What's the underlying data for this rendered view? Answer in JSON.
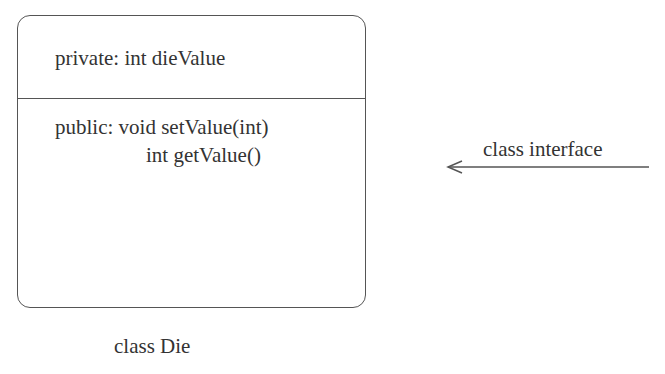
{
  "class_box": {
    "private_section": {
      "text": "private: int dieValue"
    },
    "public_section": {
      "line1": "public: void setValue(int)",
      "line2": "int getValue()"
    },
    "caption": "class Die"
  },
  "annotation": {
    "label": "class interface",
    "arrow_direction": "left"
  },
  "colors": {
    "stroke": "#555555",
    "text": "#333333",
    "background": "#ffffff"
  }
}
